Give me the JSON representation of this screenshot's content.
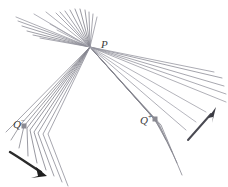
{
  "figure": {
    "type": "geometric-ray-diagram",
    "canvas": {
      "width": 228,
      "height": 187,
      "background": "#ffffff"
    },
    "colors": {
      "ray": "#8c8c96",
      "ray_dark": "#6e6e78",
      "ray_light": "#a9a9b2",
      "arrow": "#2b2b2b",
      "arrow_right": "#4a4a52",
      "label": "#3c3c3c",
      "marker": "#8a8a92"
    },
    "points": [
      {
        "id": "P",
        "label": "P",
        "superscript": "",
        "x": 90,
        "y": 47,
        "marker": false
      },
      {
        "id": "Qminus",
        "label": "Q",
        "superscript": "−",
        "x": 24,
        "y": 126,
        "marker": true
      },
      {
        "id": "Qplus",
        "label": "Q",
        "superscript": "+",
        "x": 155,
        "y": 120,
        "marker": true
      }
    ],
    "labels": {
      "P": "P",
      "Q_minus_base": "Q",
      "Q_minus_sup": "−",
      "Q_plus_base": "Q",
      "Q_plus_sup": "+"
    },
    "arrows": [
      {
        "id": "arrow-left",
        "description": "bold arrow at lower-left pointing down-right",
        "from": {
          "x": 12,
          "y": 154
        },
        "to": {
          "x": 45,
          "y": 175
        },
        "color": "#2b2b2b"
      },
      {
        "id": "arrow-right",
        "description": "arrow at right pointing up-right",
        "from": {
          "x": 190,
          "y": 138
        },
        "to": {
          "x": 215,
          "y": 111
        },
        "color": "#4a4a52"
      }
    ],
    "ray_bundles": [
      {
        "id": "fan-upper-left",
        "description": "fan of rays from P toward upper-left",
        "origin": {
          "x": 90,
          "y": 47
        },
        "count": 9,
        "angle_start_deg": 168,
        "angle_end_deg": 202,
        "length": 78
      },
      {
        "id": "fan-upper-right",
        "description": "narrow near-vertical fan of rays from P upward",
        "origin": {
          "x": 90,
          "y": 47
        },
        "count": 9,
        "angle_start_deg": 258,
        "angle_end_deg": 288,
        "length": 48
      },
      {
        "id": "fan-lower-left-to-Qminus",
        "description": "rays from P converging through Q-minus and continuing past it",
        "origin": {
          "x": 90,
          "y": 47
        },
        "focus": {
          "x": 24,
          "y": 126
        },
        "count": 9,
        "spread": 26,
        "extension": 62
      },
      {
        "id": "fan-lower-right-to-Qplus",
        "description": "rays from P converging through Q-plus and continuing past it",
        "origin": {
          "x": 90,
          "y": 47
        },
        "focus": {
          "x": 155,
          "y": 120
        },
        "count": 9,
        "spread": 30,
        "extension": 58
      }
    ]
  }
}
